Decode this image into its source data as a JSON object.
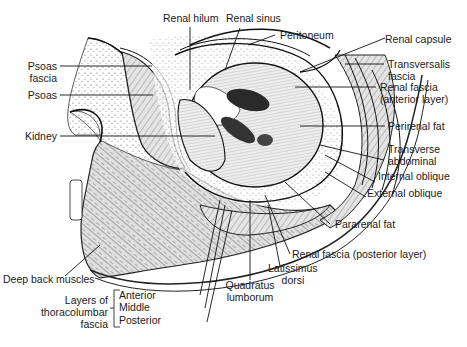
{
  "figure": {
    "labels": {
      "renal_hilum": "Renal hilum",
      "renal_sinus": "Renal sinus",
      "peritoneum": "Peritoneum",
      "renal_capsule": "Renal capsule",
      "psoas_fascia_1": "Psoas",
      "psoas_fascia_2": "fascia",
      "transversalis_1": "Transversalis",
      "transversalis_2": "fascia",
      "psoas": "Psoas",
      "renal_fascia_ant_1": "Renal fascia",
      "renal_fascia_ant_2": "(anterior layer)",
      "kidney": "Kidney",
      "perirenal_fat": "Perirenal fat",
      "transverse_1": "Transverse",
      "transverse_2": "abdominal",
      "internal_oblique": "Internal oblique",
      "external_oblique": "External oblique",
      "pararenal_fat": "Pararenal fat",
      "renal_fascia_post": "Renal fascia (posterior layer)",
      "latissimus_1": "Latissimus",
      "latissimus_2": "dorsi",
      "quadratus_1": "Quadratus",
      "quadratus_2": "lumborum",
      "deep_back": "Deep back muscles",
      "layers_1": "Layers of",
      "layers_2": "thoracolumbar",
      "layers_3": "fascia",
      "anterior": "Anterior",
      "middle": "Middle",
      "posterior": "Posterior"
    }
  }
}
